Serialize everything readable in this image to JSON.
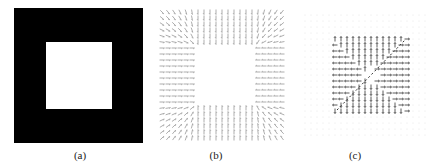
{
  "figure": {
    "panels": [
      {
        "id": "a",
        "caption": "(a)",
        "description": "binary image: white square on black background",
        "outer_box": {
          "x": 14,
          "y": 8,
          "w": 129,
          "h": 135,
          "color": "#000000"
        },
        "inner_box": {
          "x": 46,
          "y": 42,
          "w": 66,
          "h": 67,
          "color": "#ffffff"
        },
        "caption_pos": {
          "x": 60,
          "y": 149
        }
      },
      {
        "id": "b",
        "caption": "(b)",
        "description": "vector field: arrows point toward the square boundary; horizontal in side bands, vertical in top/bottom bands, diagonal at corners",
        "region": {
          "x": 160,
          "y": 10,
          "w": 125,
          "h": 133
        },
        "inner_empty": {
          "x": 198,
          "y": 47,
          "w": 57,
          "h": 56
        },
        "spacing": 6,
        "arrow_len": 5,
        "color": "#8a8a8a",
        "caption_pos": {
          "x": 196,
          "y": 149
        }
      },
      {
        "id": "c",
        "caption": "(c)",
        "description": "sparse vector field: arrows inside the square point outward from the center, with a diagonal line; faint dot grid outside",
        "grid_region": {
          "x": 305,
          "y": 15,
          "w": 122,
          "h": 125
        },
        "active_region": {
          "x": 334,
          "y": 38,
          "w": 73,
          "h": 74
        },
        "spacing": 6,
        "arrow_len": 5,
        "arrow_color": "#333333",
        "dot_color": "#dddddd",
        "diagonal": {
          "x1": 337,
          "y1": 110,
          "x2": 405,
          "y2": 40
        },
        "caption_pos": {
          "x": 335,
          "y": 149
        }
      }
    ]
  }
}
